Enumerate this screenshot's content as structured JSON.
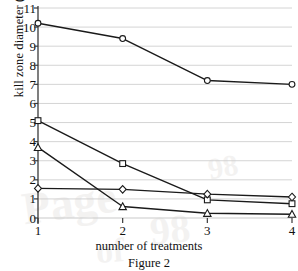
{
  "chart_data": {
    "type": "line",
    "title": "",
    "caption": "Figure 2",
    "xlabel": "number of treatments",
    "ylabel": "kill zone diameter (mm)",
    "x": [
      1,
      2,
      3,
      4
    ],
    "xticklabels": [
      "1",
      "2",
      "3",
      "4"
    ],
    "yticklabels": [
      "0",
      "1",
      "2",
      "3",
      "4",
      "5",
      "6",
      "7",
      "8",
      "9",
      "10",
      "11"
    ],
    "xlim": [
      1,
      4
    ],
    "ylim": [
      0,
      11
    ],
    "grid": "horizontal",
    "legend": "none",
    "line_color": "#1a1a1a",
    "grid_color": "#c9c9c9",
    "axis_color": "#3a3a3a",
    "series": [
      {
        "name": "circle-series",
        "marker": "circle",
        "values": [
          10.2,
          9.4,
          7.2,
          7.0
        ]
      },
      {
        "name": "square-series",
        "marker": "square",
        "values": [
          5.1,
          2.85,
          0.95,
          0.75
        ]
      },
      {
        "name": "triangle-series",
        "marker": "triangle",
        "values": [
          3.7,
          0.6,
          0.25,
          0.2
        ]
      },
      {
        "name": "diamond-series",
        "marker": "diamond",
        "values": [
          1.55,
          1.5,
          1.25,
          1.1
        ]
      }
    ]
  },
  "watermark": {
    "w1": "Page",
    "w2": "98",
    "w3": "of",
    "w4": "98"
  }
}
